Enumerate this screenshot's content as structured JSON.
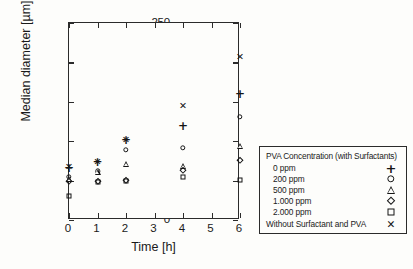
{
  "chart_data": {
    "type": "scatter",
    "title": "",
    "xlabel": "Time [h]",
    "ylabel": "Median diameter [µm]",
    "xlim": [
      0,
      6
    ],
    "ylim": [
      0,
      250
    ],
    "xticks": [
      "0",
      "1",
      "2",
      "3",
      "4",
      "5",
      "6"
    ],
    "yticks": [
      "0",
      "50",
      "100",
      "150",
      "200",
      "250"
    ],
    "grid": false,
    "legend_position": "right-outside",
    "legend_title": "PVA Concentration (with Surfactants)",
    "x": [
      0,
      1,
      2,
      4,
      6
    ],
    "series": [
      {
        "name": "0 ppm",
        "marker": "plus",
        "values": [
          66,
          73,
          101,
          119,
          160
        ]
      },
      {
        "name": "200 ppm",
        "marker": "circle",
        "values": [
          55,
          62,
          89,
          92,
          131
        ]
      },
      {
        "name": "500 ppm",
        "marker": "triangle",
        "values": [
          52,
          61,
          71,
          68,
          94
        ]
      },
      {
        "name": "1.000 ppm",
        "marker": "diamond",
        "values": [
          50,
          49,
          51,
          64,
          76
        ]
      },
      {
        "name": "2.000 ppm",
        "marker": "square",
        "values": [
          31,
          48,
          50,
          55,
          51
        ]
      },
      {
        "name": "Without Surfactant and PVA",
        "marker": "cross",
        "values": [
          67,
          73,
          102,
          145,
          207
        ]
      }
    ]
  },
  "glyphs": {
    "plus": "+",
    "cross": "✕"
  }
}
